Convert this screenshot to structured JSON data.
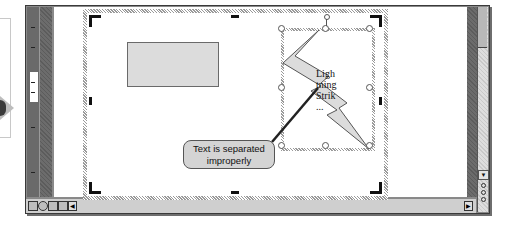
{
  "callout": {
    "text": "Text is separated improperly"
  },
  "shape": {
    "type": "lightning-bolt",
    "text_lines": [
      "Ligh",
      "tning",
      "Strik",
      "..."
    ]
  },
  "icons": {
    "left_arrow": "right-arrow-icon",
    "view_buttons": [
      "normal-view-icon",
      "outline-view-icon",
      "slide-view-icon",
      "slide-sorter-view-icon",
      "slide-show-icon"
    ],
    "scroll_up": "▲",
    "scroll_down": "▼",
    "scroll_left": "◀",
    "scroll_right": "▶"
  },
  "colors": {
    "window_frame": "#8a8a8a",
    "shape_fill": "#dcdcdc",
    "callout_fill": "#d4d4d4",
    "selection_hatch": "#9a9a9a"
  }
}
